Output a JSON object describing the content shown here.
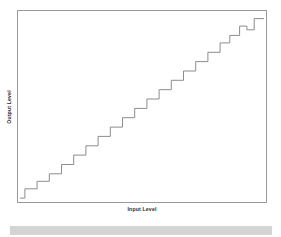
{
  "figure": {
    "background_color": "#ffffff",
    "frame_color": "#9a9a9a",
    "line_color": "#8c8c8c",
    "bottom_bar_color": "#d4d4d4"
  },
  "chart_data": {
    "type": "line",
    "title": "",
    "subtitle": "",
    "xlabel": "Input Level",
    "ylabel": "Output Level",
    "xlim": [
      0,
      100
    ],
    "ylim": [
      0,
      100
    ],
    "grid": false,
    "legend": null,
    "xticklabels": [],
    "yticklabels": [],
    "annotations": [],
    "series": [
      {
        "name": "Quantized transfer curve",
        "style": "step-post",
        "x": [
          0,
          2,
          2,
          7,
          7,
          12,
          12,
          17,
          17,
          22,
          22,
          27,
          27,
          32,
          32,
          37,
          37,
          42,
          42,
          47,
          47,
          52,
          52,
          57,
          57,
          62,
          62,
          67,
          67,
          72,
          72,
          77,
          77,
          82,
          82,
          86,
          86,
          90,
          90,
          93,
          93,
          96,
          96,
          100
        ],
        "y": [
          1,
          1,
          6,
          6,
          10,
          10,
          14,
          14,
          19,
          19,
          24,
          24,
          29,
          29,
          34,
          34,
          39,
          39,
          44,
          44,
          49,
          49,
          54,
          54,
          59,
          59,
          64,
          64,
          69,
          69,
          74,
          74,
          79,
          79,
          84,
          84,
          88,
          88,
          93,
          93,
          91,
          91,
          97,
          97
        ],
        "step_count": 21,
        "description": "Monotonic staircase quantization curve rising from lower-left to upper-right with one small downward notch near the top right"
      }
    ]
  }
}
